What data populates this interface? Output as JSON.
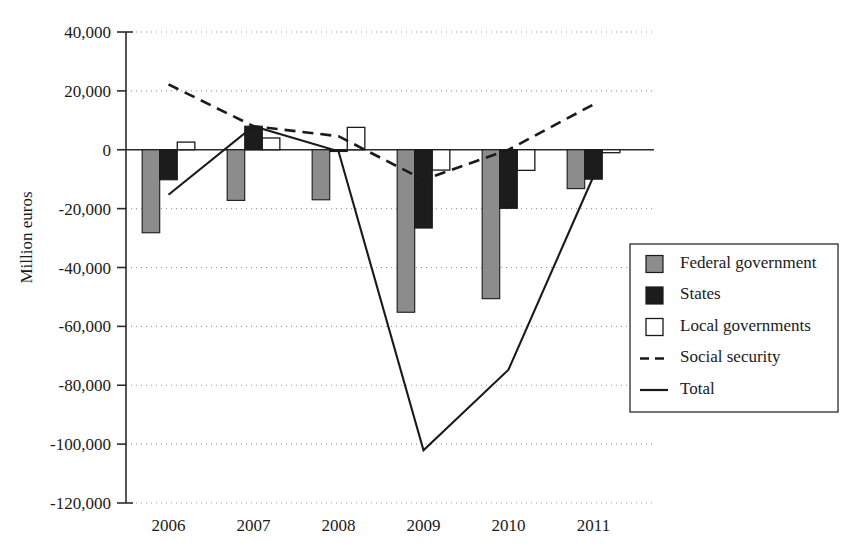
{
  "chart_data": {
    "type": "bar",
    "title": "",
    "subtitle": "",
    "xlabel": "",
    "ylabel": "Million euros",
    "categories": [
      "2006",
      "2007",
      "2008",
      "2009",
      "2010",
      "2011"
    ],
    "ylim": [
      -120000,
      40000
    ],
    "yticks": [
      40000,
      20000,
      0,
      -20000,
      -40000,
      -60000,
      -80000,
      -100000,
      -120000
    ],
    "ytick_labels": [
      "40,000",
      "20,000",
      "0",
      "-20,000",
      "-40,000",
      "-60,000",
      "-80,000",
      "-100,000",
      "-120,000"
    ],
    "grid": true,
    "legend_position": "right",
    "bar_series": [
      {
        "name": "Federal government",
        "style": "bar",
        "color": "#8c8c8c",
        "values": [
          -28200,
          -17200,
          -17000,
          -55200,
          -50600,
          -13200
        ]
      },
      {
        "name": "States",
        "style": "bar",
        "color": "#1c1c1c",
        "values": [
          -10200,
          8000,
          -600,
          -26600,
          -19900,
          -10000
        ]
      },
      {
        "name": "Local governments",
        "style": "bar",
        "color": "#ffffff",
        "values": [
          2600,
          4000,
          7600,
          -6900,
          -7000,
          -1000
        ]
      }
    ],
    "line_series": [
      {
        "name": "Social security",
        "style": "dashed-line",
        "color": "#1a1a1a",
        "values": [
          22200,
          8000,
          4600,
          -10200,
          0,
          15400
        ]
      },
      {
        "name": "Total",
        "style": "solid-line",
        "color": "#1a1a1a",
        "values": [
          -15300,
          8000,
          -500,
          -102100,
          -74700,
          -9000
        ]
      }
    ],
    "legend_entries": [
      {
        "label": "Federal government",
        "marker": "filled-gray-square"
      },
      {
        "label": "States",
        "marker": "filled-black-square"
      },
      {
        "label": "Local governments",
        "marker": "open-square"
      },
      {
        "label": "Social security",
        "marker": "dashed-line"
      },
      {
        "label": "Total",
        "marker": "solid-line"
      }
    ]
  }
}
